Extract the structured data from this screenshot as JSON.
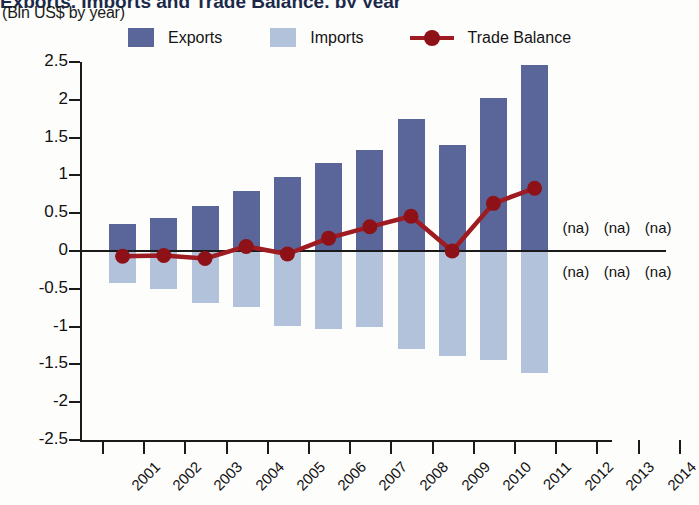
{
  "header": {
    "title": "Exports, Imports and Trade Balance, by year",
    "subtitle": "(Bln US$ by year)"
  },
  "legend": {
    "position": "top",
    "items": [
      {
        "label": "Exports",
        "color": "#5a6699",
        "marker": "square"
      },
      {
        "label": "Imports",
        "color": "#b3c2db",
        "marker": "square"
      },
      {
        "label": "Trade Balance",
        "color": "#9e1b22",
        "marker": "line-circle"
      }
    ]
  },
  "colors": {
    "exports": "#5a6699",
    "imports": "#b3c2db",
    "trade_balance": "#9e1b22",
    "trade_balance_marker": "#8e1117",
    "axis": "#1a1a1a",
    "background": "#fdfdfc"
  },
  "annotations": {
    "na_text": "(na)",
    "na_years": [
      "2012",
      "2013",
      "2014"
    ],
    "na_rows": 2
  },
  "chart_data": {
    "type": "bar",
    "title": "Exports, Imports and Trade Balance, by year",
    "subtitle": "(Bln US$ by year)",
    "xlabel": "",
    "ylabel": "",
    "units": "Bln US$",
    "grid": false,
    "legend_position": "top",
    "categories": [
      "2001",
      "2002",
      "2003",
      "2004",
      "2005",
      "2006",
      "2007",
      "2008",
      "2009",
      "2010",
      "2011",
      "2012",
      "2013",
      "2014"
    ],
    "ylim": [
      -2.5,
      2.5
    ],
    "yticks": [
      2.5,
      2,
      1.5,
      1,
      0.5,
      0,
      -0.5,
      -1,
      -1.5,
      -2,
      -2.5
    ],
    "ytick_labels": [
      "2.5",
      "2",
      "1.5",
      "1",
      "0.5",
      "0",
      "-0.5",
      "-1",
      "-1.5",
      "-2",
      "-2.5"
    ],
    "series": [
      {
        "name": "Exports",
        "type": "bar",
        "color": "#5a6699",
        "values": [
          0.36,
          0.44,
          0.59,
          0.79,
          0.98,
          1.16,
          1.34,
          1.74,
          1.4,
          2.03,
          2.46,
          null,
          null,
          null
        ]
      },
      {
        "name": "Imports",
        "type": "bar",
        "color": "#b3c2db",
        "values": [
          -0.42,
          -0.5,
          -0.69,
          -0.74,
          -0.99,
          -1.03,
          -1.0,
          -1.3,
          -1.39,
          -1.44,
          -1.62,
          null,
          null,
          null
        ]
      },
      {
        "name": "Trade Balance",
        "type": "line",
        "color": "#9e1b22",
        "values": [
          -0.07,
          -0.06,
          -0.1,
          0.06,
          -0.04,
          0.17,
          0.32,
          0.46,
          0.0,
          0.63,
          0.83,
          null,
          null,
          null
        ]
      }
    ]
  }
}
